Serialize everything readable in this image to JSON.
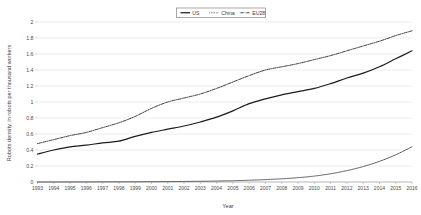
{
  "chart_data": {
    "type": "line",
    "title": "",
    "xlabel": "Year",
    "ylabel": "Robots density, in robots per thousand workers",
    "xlim": [
      1993,
      2016
    ],
    "ylim": [
      0,
      2
    ],
    "ytick_step": 0.2,
    "grid": true,
    "legend_position": "top-center",
    "categories": [
      "1993",
      "1994",
      "1995",
      "1996",
      "1997",
      "1998",
      "1999",
      "2000",
      "2001",
      "2002",
      "2003",
      "2004",
      "2005",
      "2006",
      "2007",
      "2008",
      "2009",
      "2010",
      "2011",
      "2012",
      "2013",
      "2014",
      "2015",
      "2016"
    ],
    "ytick_labels": [
      "0",
      "0.2",
      "0.4",
      "0.6",
      "0.8",
      "1",
      "1.2",
      "1.4",
      "1.6",
      "1.8",
      "2"
    ],
    "ytick_values": [
      0,
      0.2,
      0.4,
      0.6,
      0.8,
      1,
      1.2,
      1.4,
      1.6,
      1.8,
      2
    ],
    "series": [
      {
        "name": "US",
        "style": "solid",
        "color": "#1c1c1c",
        "values": [
          0.35,
          0.4,
          0.44,
          0.46,
          0.49,
          0.51,
          0.57,
          0.62,
          0.66,
          0.7,
          0.75,
          0.81,
          0.89,
          0.98,
          1.04,
          1.09,
          1.13,
          1.17,
          1.23,
          1.3,
          1.36,
          1.44,
          1.54,
          1.64
        ]
      },
      {
        "name": "China",
        "style": "dotted",
        "color": "#4a4a4a",
        "values": [
          0.0,
          0.0,
          0.001,
          0.001,
          0.002,
          0.002,
          0.003,
          0.004,
          0.005,
          0.007,
          0.009,
          0.012,
          0.016,
          0.022,
          0.03,
          0.04,
          0.054,
          0.074,
          0.103,
          0.142,
          0.193,
          0.258,
          0.34,
          0.44
        ]
      },
      {
        "name": "EU28",
        "style": "dashdot",
        "color": "#1c1c1c",
        "values": [
          0.48,
          0.53,
          0.58,
          0.62,
          0.68,
          0.74,
          0.82,
          0.92,
          1.0,
          1.05,
          1.1,
          1.17,
          1.25,
          1.33,
          1.4,
          1.44,
          1.48,
          1.53,
          1.58,
          1.64,
          1.7,
          1.76,
          1.83,
          1.89
        ]
      }
    ]
  },
  "legend": {
    "entries": [
      {
        "label": "US"
      },
      {
        "label": "China"
      },
      {
        "label": "EU28"
      }
    ]
  },
  "axes": {
    "x_title": "Year",
    "y_title": "Robots density, in robots per thousand workers"
  }
}
